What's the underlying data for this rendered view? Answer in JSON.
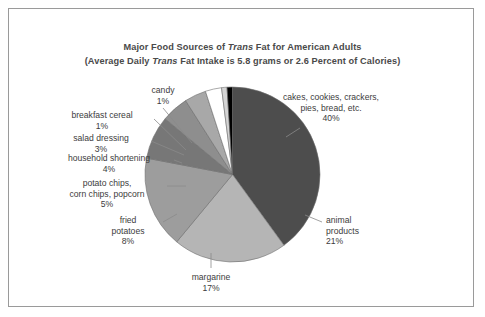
{
  "figure": {
    "border_color": "#9a9a9a",
    "background": "#ffffff",
    "title_line1_pre": "Major Food Sources of ",
    "title_line1_ital": "Trans",
    "title_line1_post": " Fat for American Adults",
    "title_line2_pre": "(Average Daily ",
    "title_line2_ital": "Trans",
    "title_line2_post": " Fat Intake is 5.8 grams or 2.6 Percent of Calories)"
  },
  "chart_data": {
    "type": "pie",
    "title": "Major Food Sources of Trans Fat for American Adults",
    "subtitle": "(Average Daily Trans Fat Intake is 5.8 grams or 2.6 Percent of Calories)",
    "unit": "percent",
    "start_angle_deg": 0,
    "direction": "clockwise",
    "legend_position": "none",
    "grid": false,
    "categories": [
      "cakes, cookies, crackers, pies, bread, etc.",
      "animal products",
      "margarine",
      "fried potatoes",
      "potato chips, corn chips, popcorn",
      "household shortening",
      "salad dressing",
      "breakfast cereal",
      "candy"
    ],
    "values": [
      40,
      21,
      17,
      8,
      5,
      4,
      3,
      1,
      1
    ],
    "colors": [
      "#4d4d4d",
      "#b5b5b5",
      "#9d9d9d",
      "#777777",
      "#8e8e8e",
      "#a8a8a8",
      "#ffffff",
      "#d4d4d4",
      "#000000"
    ]
  },
  "labels": {
    "cakes": {
      "line1": "cakes, cookies, crackers,",
      "line2": "pies, bread, etc.",
      "value": "40%"
    },
    "animal": {
      "line1": "animal",
      "line2": "products",
      "value": "21%"
    },
    "margarine": {
      "line1": "margarine",
      "value": "17%"
    },
    "fried_potatoes": {
      "line1": "fried",
      "line2": "potatoes",
      "value": "8%"
    },
    "potato_chips": {
      "line1": "potato chips,",
      "line2": "corn chips, popcorn",
      "value": "5%"
    },
    "household_shortening": {
      "line1": "household shortening",
      "value": "4%"
    },
    "salad_dressing": {
      "line1": "salad dressing",
      "value": "3%"
    },
    "breakfast_cereal": {
      "line1": "breakfast cereal",
      "value": "1%"
    },
    "candy": {
      "line1": "candy",
      "value": "1%"
    }
  }
}
